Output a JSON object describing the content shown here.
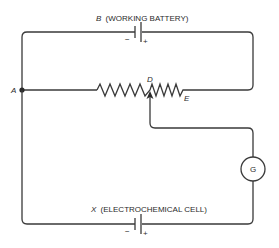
{
  "diagram": {
    "type": "potentiometer-circuit",
    "top_battery": {
      "letter": "B",
      "description": "(WORKING BATTERY)",
      "minus": "−",
      "plus": "+"
    },
    "bottom_cell": {
      "letter": "X",
      "description": "(ELECTROCHEMICAL CELL)",
      "minus": "−",
      "plus": "+"
    },
    "nodes": {
      "A": "A",
      "D": "D",
      "E": "E"
    },
    "galvanometer": {
      "label": "G"
    },
    "colors": {
      "wire": "#3a3a3a",
      "background": "#ffffff"
    }
  }
}
